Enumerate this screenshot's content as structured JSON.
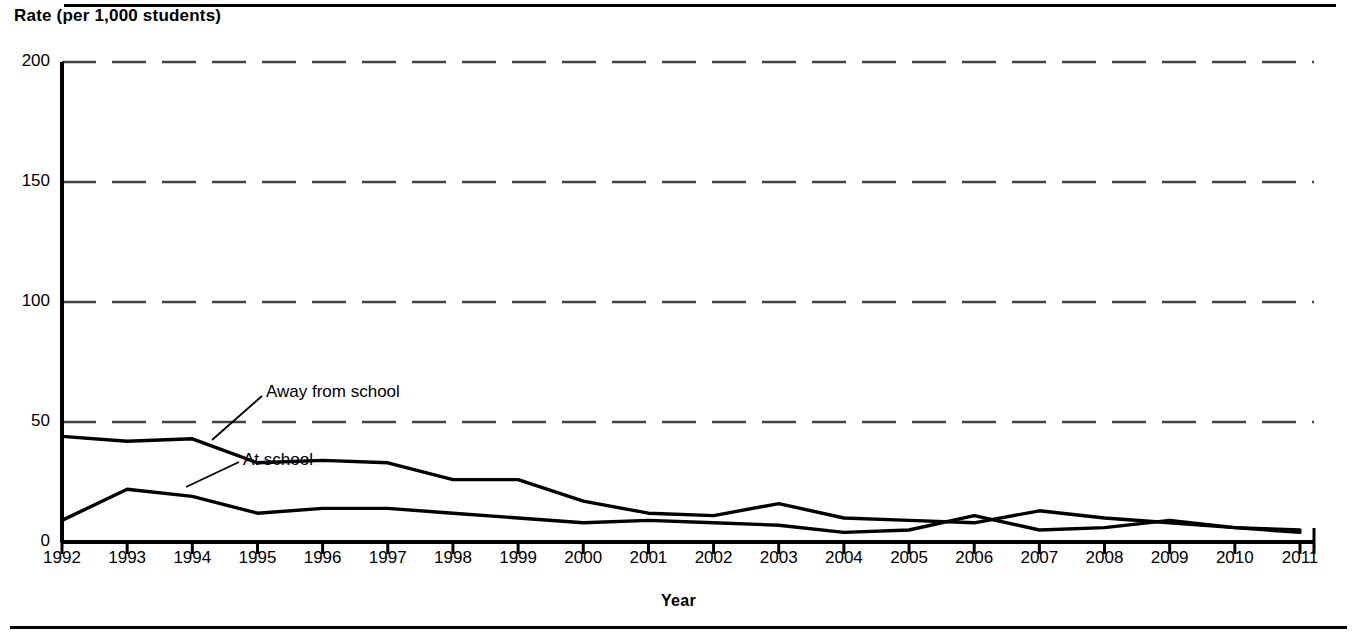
{
  "figure": {
    "y_axis_title": "Rate (per 1,000 students)",
    "x_axis_title": "Year"
  },
  "annotations": {
    "away_label": "Away from school",
    "at_label": "At school"
  },
  "chart_data": {
    "type": "line",
    "title": "",
    "xlabel": "Year",
    "ylabel": "Rate (per 1,000 students)",
    "ylim": [
      0,
      200
    ],
    "yticks": [
      0,
      50,
      100,
      150,
      200
    ],
    "ytick_labels": [
      "0",
      "50",
      "100",
      "150",
      "200"
    ],
    "grid": true,
    "grid_style": "dashed-horizontal",
    "legend": "inline-annotations",
    "categories": [
      "1992",
      "1993",
      "1994",
      "1995",
      "1996",
      "1997",
      "1998",
      "1999",
      "2000",
      "2001",
      "2002",
      "2003",
      "2004",
      "2005",
      "2006",
      "2007",
      "2008",
      "2009",
      "2010",
      "2011"
    ],
    "x": [
      1992,
      1993,
      1994,
      1995,
      1996,
      1997,
      1998,
      1999,
      2000,
      2001,
      2002,
      2003,
      2004,
      2005,
      2006,
      2007,
      2008,
      2009,
      2010,
      2011
    ],
    "series": [
      {
        "name": "Away from school",
        "color": "#000000",
        "values": [
          44,
          42,
          43,
          33,
          34,
          33,
          26,
          26,
          17,
          12,
          11,
          16,
          10,
          9,
          8,
          13,
          10,
          8,
          6,
          5
        ]
      },
      {
        "name": "At school",
        "color": "#000000",
        "values": [
          9,
          22,
          19,
          12,
          14,
          14,
          12,
          10,
          8,
          9,
          8,
          7,
          4,
          5,
          11,
          5,
          6,
          9,
          6,
          4
        ]
      }
    ]
  }
}
